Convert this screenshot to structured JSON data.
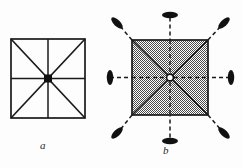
{
  "figure": {
    "type": "technical-line-diagram",
    "background_color": "#fdfdfd",
    "ink_color": "#1a1a1a",
    "panels": [
      {
        "id": "a",
        "label": "a",
        "label_style": "italic",
        "description": "Open square outline with full diagonals, a vertical midline and a horizontal midline meeting at a small solid black square marker at the centre",
        "square": {
          "x": 11,
          "y": 39,
          "width": 74,
          "height": 79,
          "fill": "none",
          "stroke": "#1a1a1a",
          "stroke_width": 1.6
        },
        "center": {
          "x": 48,
          "y": 78.5
        },
        "center_marker": {
          "shape": "filled-square",
          "size": 8,
          "color": "#111111"
        },
        "internal_lines": [
          "diagonal-tl-br",
          "diagonal-tr-bl",
          "vertical-midline",
          "horizontal-midline"
        ],
        "line_style": "solid"
      },
      {
        "id": "b",
        "label": "b",
        "label_style": "italic",
        "description": "Stipple-hatched square with solid internal diagonals and midlines, a small open white circle at the centre, and eight dashed rays extending outward from the centre past the square, each terminating in a small dark lens-shaped marker oriented perpendicular to its ray",
        "square": {
          "x": 132,
          "y": 40,
          "width": 76,
          "height": 75,
          "fill": "stipple-50-gray",
          "stroke": "#1a1a1a",
          "stroke_width": 1.6
        },
        "center": {
          "x": 170,
          "y": 77.5
        },
        "center_marker": {
          "shape": "open-circle",
          "radius": 3.2,
          "fill": "#ffffff",
          "stroke": "#111111"
        },
        "internal_lines": [
          "diagonal-tl-br",
          "diagonal-tr-bl",
          "vertical-midline",
          "horizontal-midline"
        ],
        "line_style": "solid-inside-dashed-outside",
        "ray_count": 8,
        "ray_directions_deg": [
          0,
          45,
          90,
          135,
          180,
          225,
          270,
          315
        ],
        "ray_terminator": {
          "shape": "lens-ellipse",
          "rx": 7.5,
          "ry": 3.2,
          "color": "#111111",
          "orientation": "perpendicular-to-ray"
        },
        "rays": [
          {
            "name": "ray-up",
            "angle_deg": 270,
            "tip_x": 170,
            "tip_y": 15
          },
          {
            "name": "ray-down",
            "angle_deg": 90,
            "tip_x": 170,
            "tip_y": 141
          },
          {
            "name": "ray-left",
            "angle_deg": 180,
            "tip_x": 110,
            "tip_y": 77.5
          },
          {
            "name": "ray-right",
            "angle_deg": 0,
            "tip_x": 231,
            "tip_y": 77.5
          },
          {
            "name": "ray-up-right",
            "angle_deg": 315,
            "tip_x": 224,
            "tip_y": 23
          },
          {
            "name": "ray-up-left",
            "angle_deg": 225,
            "tip_x": 117,
            "tip_y": 23
          },
          {
            "name": "ray-down-right",
            "angle_deg": 45,
            "tip_x": 224,
            "tip_y": 133
          },
          {
            "name": "ray-down-left",
            "angle_deg": 135,
            "tip_x": 117,
            "tip_y": 133
          }
        ]
      }
    ]
  }
}
